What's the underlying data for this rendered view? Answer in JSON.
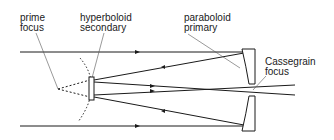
{
  "diagram": {
    "type": "Cassegrain telescope optical path",
    "labels": {
      "prime_focus": "prime\nfocus",
      "secondary": "hyperboloid\nsecondary",
      "primary": "paraboloid\nprimary",
      "cassegrain_focus": "Cassegrain\nfocus"
    },
    "colors": {
      "line": "#1a1a1a",
      "leader": "#555555",
      "background": "#ffffff"
    }
  }
}
